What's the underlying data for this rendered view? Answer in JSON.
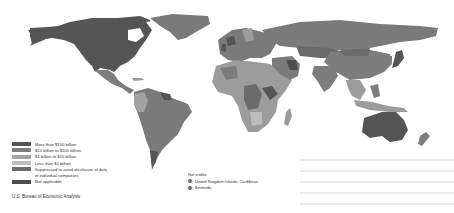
{
  "map": {
    "title": "",
    "colors": {
      "more_than_100b": "#555555",
      "10b_to_100b": "#7a7a7a",
      "1b_to_10b": "#9c9c9c",
      "less_than_1b": "#b8b8b8",
      "suppressed": "#6e6e6e",
      "not_applicable": "#4a4a4a"
    }
  },
  "legend": {
    "items": [
      {
        "label": "More than $100 billion",
        "color": "#555555"
      },
      {
        "label": "$10 billion to $100 billion",
        "color": "#7d7d7d"
      },
      {
        "label": "$1 billion to $10 billion",
        "color": "#a3a3a3"
      },
      {
        "label": "Less than $1 billion",
        "color": "#bdbdbd"
      },
      {
        "label": "Suppressed to avoid disclosure of data",
        "label_cont": "of individual companies",
        "color": "#6b6b6b"
      },
      {
        "label": "Not applicable",
        "color": "#4d4d4d"
      }
    ]
  },
  "not_visible": {
    "title": "Not visible",
    "items": [
      {
        "label": "United Kingdom Islands, Caribbean"
      },
      {
        "label": "Bermuda"
      }
    ]
  },
  "source": "U.S. Bureau of Economic Analysis"
}
